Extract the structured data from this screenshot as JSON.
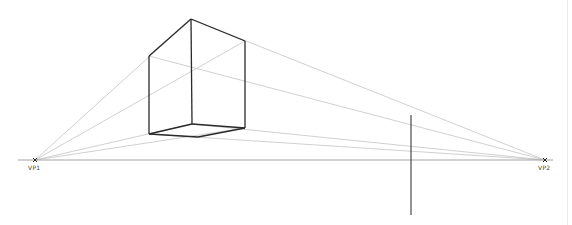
{
  "diagram": {
    "colors": {
      "background": "#ffffff",
      "construction": "#c4c4c4",
      "horizon": "#9a9a9a",
      "box": "#2a2a2a",
      "vertical": "#3a3a3a",
      "marker": "#222222"
    },
    "horizon": {
      "x1": 18,
      "y1": 160,
      "x2": 553,
      "y2": 160
    },
    "vanishing_points": [
      {
        "id": "vp1",
        "label": "VP1",
        "x": 35,
        "y": 160
      },
      {
        "id": "vp2",
        "label": "VP2",
        "x": 545,
        "y": 160
      }
    ],
    "box": {
      "front_top": [
        191,
        19
      ],
      "left_top": [
        149,
        56
      ],
      "right_top": [
        245,
        41
      ],
      "front_bottom": [
        192,
        124
      ],
      "left_bottom": [
        149,
        134
      ],
      "right_bottom": [
        245,
        128
      ],
      "back_bottom": [
        198,
        137
      ]
    },
    "vertical_line": {
      "x": 411,
      "y1": 115,
      "y2": 215
    }
  }
}
